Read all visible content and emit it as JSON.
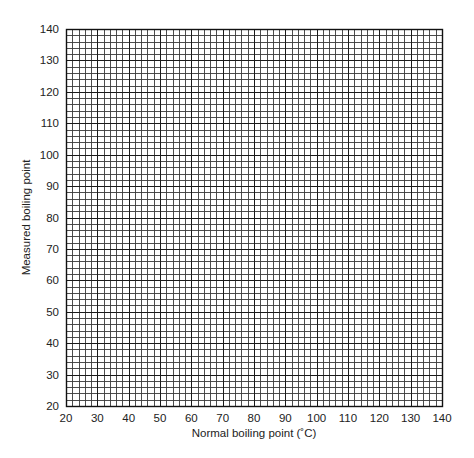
{
  "chart_data": {
    "type": "scatter",
    "title": "",
    "xlabel": "Normal boiling point (˚C)",
    "ylabel": "Measured boiling point",
    "xlim": [
      20,
      140
    ],
    "ylim": [
      20,
      140
    ],
    "x_ticks": [
      20,
      30,
      40,
      50,
      60,
      70,
      80,
      90,
      100,
      110,
      120,
      130,
      140
    ],
    "y_ticks": [
      20,
      30,
      40,
      50,
      60,
      70,
      80,
      90,
      100,
      110,
      120,
      130,
      140
    ],
    "major_step": 10,
    "minor_divisions": 5,
    "grid": true,
    "series": [],
    "legend": null
  },
  "colors": {
    "grid_minor": "#3a3a3a",
    "grid_major": "#1a1a1a",
    "text": "#222222",
    "background": "#ffffff"
  }
}
